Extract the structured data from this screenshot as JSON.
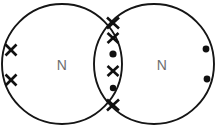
{
  "diagram": {
    "kind": "dot-and-cross-diagram",
    "molecule_label": "N2",
    "bond_type": "triple covalent bond",
    "canvas": {
      "width": 224,
      "height": 129,
      "background": "#ffffff"
    },
    "colors": {
      "outline": "#151515",
      "electron": "#101010",
      "atom_label": "#6e6e6e",
      "background": "#ffffff"
    },
    "atoms": [
      {
        "id": "atom-left",
        "label": "N",
        "label_x": 62,
        "label_y": 65,
        "circle": {
          "cx": 62,
          "cy": 64,
          "r": 60
        },
        "electron_symbol": "cross"
      },
      {
        "id": "atom-right",
        "label": "N",
        "label_x": 162,
        "label_y": 65,
        "circle": {
          "cx": 154,
          "cy": 64,
          "r": 60
        },
        "electron_symbol": "dot"
      }
    ],
    "lone_pairs": [
      {
        "owner": "atom-left",
        "symbol": "cross",
        "x": 11,
        "y": 50
      },
      {
        "owner": "atom-left",
        "symbol": "cross",
        "x": 11,
        "y": 80
      },
      {
        "owner": "atom-right",
        "symbol": "dot",
        "x": 206,
        "y": 49
      },
      {
        "owner": "atom-right",
        "symbol": "dot",
        "x": 207,
        "y": 79
      }
    ],
    "shared_electrons": [
      {
        "symbol": "cross",
        "x": 113,
        "y": 23,
        "position": "top-intersection"
      },
      {
        "symbol": "cross",
        "x": 113,
        "y": 38,
        "position": "overlap-upper"
      },
      {
        "symbol": "dot",
        "x": 113,
        "y": 54,
        "position": "overlap-upper-mid"
      },
      {
        "symbol": "cross",
        "x": 113,
        "y": 71,
        "position": "overlap-lower-mid"
      },
      {
        "symbol": "dot",
        "x": 113,
        "y": 88,
        "position": "overlap-lower"
      },
      {
        "symbol": "cross",
        "x": 113,
        "y": 105,
        "position": "bottom-intersection"
      }
    ],
    "counts": {
      "cross_electrons_total": 6,
      "dot_electrons_total": 4,
      "shared_pairs": 3
    }
  }
}
